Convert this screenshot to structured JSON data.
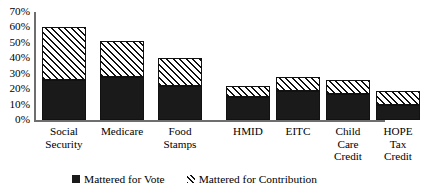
{
  "chart_data": {
    "type": "bar",
    "subtype": "stacked",
    "title": "",
    "xlabel": "",
    "ylabel": "",
    "ylim": [
      0,
      70
    ],
    "ytick_labels": [
      "70%",
      "60%",
      "50%",
      "40%",
      "30%",
      "20%",
      "10%",
      "0%"
    ],
    "ytick_values": [
      70,
      60,
      50,
      40,
      30,
      20,
      10,
      0
    ],
    "grid": false,
    "legend_position": "bottom",
    "categories": [
      "Social Security",
      "Medicare",
      "Food Stamps",
      "HMID",
      "EITC",
      "Child Care Credit",
      "HOPE Tax Credit"
    ],
    "category_lines": [
      [
        "Social",
        "Security"
      ],
      [
        "Medicare"
      ],
      [
        "Food",
        "Stamps"
      ],
      [
        "HMID"
      ],
      [
        "EITC"
      ],
      [
        "Child",
        "Care",
        "Credit"
      ],
      [
        "HOPE",
        "Tax",
        "Credit"
      ]
    ],
    "series": [
      {
        "name": "Mattered for Vote",
        "fill": "solid-black",
        "color": "#1a1a1a",
        "values": [
          26,
          28,
          22,
          15,
          19,
          17,
          10
        ]
      },
      {
        "name": "Mattered for Contribution",
        "fill": "diagonal-hatch",
        "color": "#111111",
        "values": [
          34,
          23,
          18,
          7,
          9,
          9,
          9
        ]
      }
    ],
    "stacked_totals": [
      60,
      51,
      40,
      22,
      28,
      26,
      19
    ]
  },
  "legend": {
    "entries": [
      {
        "label": "Mattered for Vote",
        "swatch": "solid-swatch-icon"
      },
      {
        "label": "Mattered for Contribution",
        "swatch": "hatch-swatch-icon"
      }
    ]
  }
}
